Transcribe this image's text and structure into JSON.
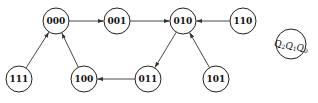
{
  "diagram": {
    "type": "state-transition",
    "nodes": [
      {
        "id": "000",
        "label": "000",
        "cx": 56,
        "cy": 21
      },
      {
        "id": "001",
        "label": "001",
        "cx": 117,
        "cy": 21
      },
      {
        "id": "010",
        "label": "010",
        "cx": 183,
        "cy": 21
      },
      {
        "id": "110",
        "label": "110",
        "cx": 243,
        "cy": 21
      },
      {
        "id": "111",
        "label": "111",
        "cx": 19,
        "cy": 79
      },
      {
        "id": "100",
        "label": "100",
        "cx": 84,
        "cy": 79
      },
      {
        "id": "011",
        "label": "011",
        "cx": 148,
        "cy": 79
      },
      {
        "id": "101",
        "label": "101",
        "cx": 216,
        "cy": 79
      }
    ],
    "edges": [
      {
        "from": "000",
        "to": "001"
      },
      {
        "from": "001",
        "to": "010"
      },
      {
        "from": "110",
        "to": "010"
      },
      {
        "from": "010",
        "to": "011"
      },
      {
        "from": "101",
        "to": "010"
      },
      {
        "from": "011",
        "to": "100"
      },
      {
        "from": "100",
        "to": "000"
      },
      {
        "from": "111",
        "to": "000"
      }
    ],
    "legend": {
      "label": "Q2Q1Q0",
      "parts": [
        {
          "var": "Q",
          "sub": "2"
        },
        {
          "var": "Q",
          "sub": "1"
        },
        {
          "var": "Q",
          "sub": "0"
        }
      ]
    }
  }
}
